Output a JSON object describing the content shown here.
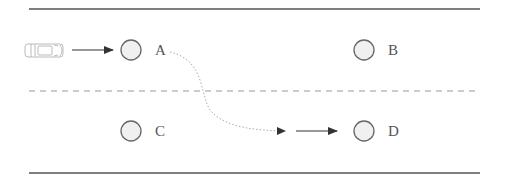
{
  "diagram": {
    "colors": {
      "line": "#555555",
      "lane_divider": "#999999",
      "circle_stroke": "#666666",
      "circle_fill": "#f0f0f0",
      "path": "#aaaaaa",
      "car": "#aaaaaa"
    },
    "road": {
      "top_edge": "solid",
      "center_divider": "dashed",
      "bottom_edge": "solid"
    },
    "vehicle": {
      "icon": "car-icon",
      "lane": "top",
      "heading": "right"
    },
    "nodes": [
      {
        "id": "A",
        "label": "A",
        "lane": "top",
        "position": "left"
      },
      {
        "id": "B",
        "label": "B",
        "lane": "top",
        "position": "right"
      },
      {
        "id": "C",
        "label": "C",
        "lane": "bottom",
        "position": "left"
      },
      {
        "id": "D",
        "label": "D",
        "lane": "bottom",
        "position": "right"
      }
    ],
    "edges": [
      {
        "from": "car",
        "to": "A",
        "style": "solid-arrow"
      },
      {
        "from": "A",
        "to": "D-approach",
        "style": "dotted-curve-arrow"
      },
      {
        "from": "D-approach",
        "to": "D",
        "style": "solid-arrow"
      }
    ]
  }
}
